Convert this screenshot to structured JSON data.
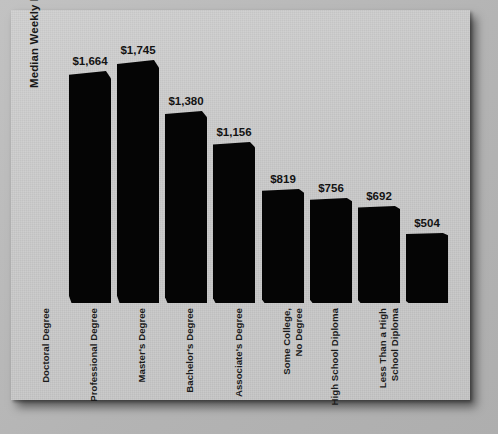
{
  "chart_data": {
    "type": "bar",
    "title": "",
    "xlabel": "",
    "ylabel": "Median Weekly Earnings ($)",
    "ylim": [
      0,
      1900
    ],
    "grid": false,
    "legend": "none",
    "orientation": "vertical",
    "bar_color": "#050505",
    "background_color": "#c9c9c9",
    "categories": [
      "Doctoral Degree",
      "Professional Degree",
      "Master's Degree",
      "Bachelor's Degree",
      "Associate's Degree",
      "Some College, No Degree",
      "High School Diploma",
      "Less Than a High School Diploma"
    ],
    "category_lines": [
      [
        "Doctoral Degree"
      ],
      [
        "Professional Degree"
      ],
      [
        "Master's Degree"
      ],
      [
        "Bachelor's Degree"
      ],
      [
        "Associate's Degree"
      ],
      [
        "Some College,",
        "No Degree"
      ],
      [
        "High School Diploma"
      ],
      [
        "Less Than a High",
        "School Diploma"
      ]
    ],
    "values": [
      1664,
      1745,
      1380,
      1156,
      819,
      756,
      692,
      504
    ],
    "value_labels": [
      "$1,664",
      "$1,745",
      "$1,380",
      "$1,156",
      "$819",
      "$756",
      "$692",
      "$504"
    ]
  }
}
